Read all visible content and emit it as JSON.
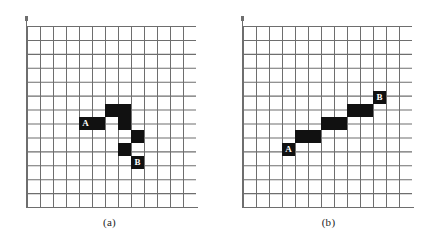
{
  "page": {
    "background_color": "#ffffff",
    "ink_color": "#111111",
    "grid_line_color": "#6e6e6e"
  },
  "chart_data": {
    "type": "heatmap",
    "title": "",
    "xlabel": "",
    "ylabel": "",
    "grid": {
      "columns": 13,
      "rows": 13,
      "cell_px": 13,
      "grid_on": true
    },
    "legend_position": "none",
    "panels": [
      {
        "id": "a",
        "caption": "(a)",
        "start_label": "A",
        "end_label": "B",
        "filled_cells": [
          {
            "col": 6,
            "row": 6
          },
          {
            "col": 7,
            "row": 6
          },
          {
            "col": 4,
            "row": 7,
            "label": "A"
          },
          {
            "col": 5,
            "row": 7
          },
          {
            "col": 7,
            "row": 7
          },
          {
            "col": 8,
            "row": 8
          },
          {
            "col": 7,
            "row": 9
          },
          {
            "col": 8,
            "row": 10,
            "label": "B"
          }
        ]
      },
      {
        "id": "b",
        "caption": "(b)",
        "start_label": "A",
        "end_label": "B",
        "filled_cells": [
          {
            "col": 3,
            "row": 9,
            "label": "A"
          },
          {
            "col": 4,
            "row": 8
          },
          {
            "col": 5,
            "row": 8
          },
          {
            "col": 6,
            "row": 7
          },
          {
            "col": 7,
            "row": 7
          },
          {
            "col": 8,
            "row": 6
          },
          {
            "col": 9,
            "row": 6
          },
          {
            "col": 10,
            "row": 5,
            "label": "B"
          }
        ]
      }
    ]
  }
}
